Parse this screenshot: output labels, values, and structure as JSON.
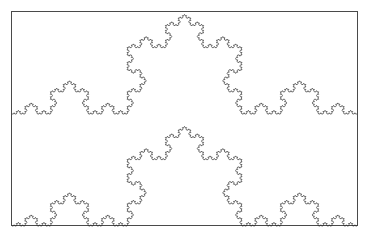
{
  "figure": {
    "kind": "fractal-line-drawing",
    "background_color": "#ffffff",
    "canvas": {
      "width": 370,
      "height": 243
    }
  },
  "frame": {
    "name": "plot-border",
    "x": 11.5,
    "y": 11.5,
    "width": 346,
    "height": 214,
    "stroke_color": "#4a4a4a",
    "stroke_width": 1,
    "fill": "none"
  },
  "curves": [
    {
      "id": "koch-curve-upper",
      "label": "Upper Koch curve",
      "iterations": 5,
      "orientation": "up",
      "start_x": 12,
      "end_x": 357,
      "baseline_y": 114,
      "peak_y": 14.4,
      "span": 345,
      "peak_height": 99.6,
      "stroke_color": "#333333",
      "stroke_width": 0.7
    },
    {
      "id": "koch-curve-lower",
      "label": "Lower Koch curve",
      "iterations": 5,
      "orientation": "up",
      "start_x": 12,
      "end_x": 357,
      "baseline_y": 226,
      "peak_y": 126.4,
      "span": 345,
      "peak_height": 99.6,
      "stroke_color": "#333333",
      "stroke_width": 0.7
    }
  ],
  "chart_data": {
    "type": "line",
    "xlabel": "",
    "ylabel": "",
    "series": [
      {
        "name": "Upper Koch curve",
        "iterations": 5,
        "segments": 1024,
        "baseline_y": 114,
        "apex_y": 14.4,
        "x_start": 12,
        "x_end": 357
      },
      {
        "name": "Lower Koch curve",
        "iterations": 5,
        "segments": 1024,
        "baseline_y": 226,
        "apex_y": 126.4,
        "x_start": 12,
        "x_end": 357
      }
    ],
    "xlim": [
      11.5,
      357.5
    ],
    "ylim": [
      11.5,
      225.5
    ],
    "grid": false,
    "legend": "none"
  }
}
